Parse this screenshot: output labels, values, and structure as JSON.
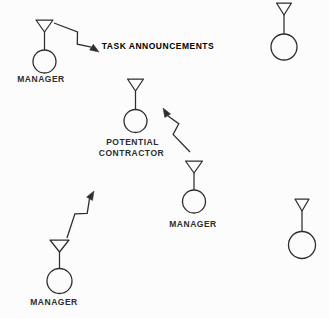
{
  "figure": {
    "kind": "contract-net-task-announcement-diagram",
    "background": "#fcfcfc",
    "ink": "#2e2e2e",
    "width": 329,
    "height": 318
  },
  "annotation": {
    "text": "TASK ANNOUNCEMENTS"
  },
  "nodes": [
    {
      "id": "manager-top-left",
      "cx": 44.5,
      "ty": 20,
      "cy": 61.5,
      "r": 11.5,
      "tw": 17,
      "label_lines": [
        {
          "text": "MANAGER",
          "x": 41,
          "y": 82
        }
      ]
    },
    {
      "id": "agent-top-right",
      "cx": 284,
      "ty": 3,
      "cy": 47,
      "r": 13,
      "tw": 15,
      "label_lines": []
    },
    {
      "id": "potential-contractor",
      "cx": 135.5,
      "ty": 79,
      "cy": 121,
      "r": 11.5,
      "tw": 16,
      "label_lines": [
        {
          "text": "POTENTIAL",
          "x": 132.5,
          "y": 145
        },
        {
          "text": "CONTRACTOR",
          "x": 131.5,
          "y": 155.8
        }
      ]
    },
    {
      "id": "manager-middle",
      "cx": 194,
      "ty": 161,
      "cy": 201.5,
      "r": 11.5,
      "tw": 17,
      "label_lines": [
        {
          "text": "MANAGER",
          "x": 193,
          "y": 226.5
        }
      ]
    },
    {
      "id": "agent-bottom-right",
      "cx": 302,
      "ty": 199,
      "cy": 245,
      "r": 13.5,
      "tw": 14,
      "label_lines": []
    },
    {
      "id": "manager-bottom-left",
      "cx": 59.5,
      "ty": 240,
      "cy": 281,
      "r": 12.5,
      "tw": 19,
      "label_lines": [
        {
          "text": "MANAGER",
          "x": 54,
          "y": 305
        }
      ]
    }
  ],
  "arrows": [
    {
      "id": "task-announcement-bolt-top-left",
      "from": "manager-top-left",
      "x1": 54,
      "y1": 23,
      "x2": 99,
      "y2": 52,
      "zig": -1
    },
    {
      "id": "task-announcement-bolt-middle",
      "from": "manager-middle",
      "x1": 190,
      "y1": 152,
      "x2": 163,
      "y2": 108,
      "zig": -1
    },
    {
      "id": "task-announcement-bolt-bottom-left",
      "from": "manager-bottom-left",
      "x1": 67,
      "y1": 238,
      "x2": 94,
      "y2": 191,
      "zig": -1
    }
  ]
}
